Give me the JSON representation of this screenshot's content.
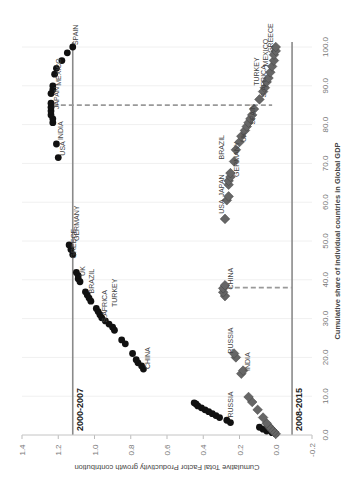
{
  "chart_data": {
    "type": "scatter",
    "orientation": "rotated 90deg clockwise",
    "title": "",
    "xlabel": "Cumulative share of individual countries in Global GDP",
    "ylabel": "Cumulative Total Factor Productivity growth contribution",
    "xlim": [
      0,
      100
    ],
    "ylim": [
      -0.2,
      1.4
    ],
    "x_ticks": [
      "0.0",
      "10.0",
      "20.0",
      "30.0",
      "40.0",
      "50.0",
      "60.0",
      "70.0",
      "80.0",
      "90.0",
      "100.0"
    ],
    "y_ticks": [
      "-0.2",
      "0.0",
      "0.2",
      "0.4",
      "0.6",
      "0.8",
      "1.0",
      "1.2",
      "1.4"
    ],
    "grid": "vertical gridlines (light)",
    "legend": "none (period labels inline)",
    "reference_lines": [
      {
        "type": "horizontal",
        "series": "2000-2007",
        "y": 1.12,
        "label": "2000-2007"
      },
      {
        "type": "horizontal",
        "series": "2008-2015",
        "y": -0.09,
        "label": "2008-2015"
      },
      {
        "type": "vertical-dashed",
        "x": 85,
        "from_y": 0.02,
        "to_y": 1.23
      },
      {
        "type": "vertical-dashed",
        "x": 38,
        "from_y": -0.09,
        "to_y": 0.27
      }
    ],
    "series": [
      {
        "name": "2000-2007",
        "marker": "circle",
        "color": "#111111",
        "points": [
          [
            0.3,
            0.0
          ],
          [
            0.6,
            0.02
          ],
          [
            1.0,
            0.05
          ],
          [
            1.5,
            0.07
          ],
          [
            2.0,
            0.09
          ],
          [
            3.2,
            0.25
          ],
          [
            3.8,
            0.27
          ],
          [
            4.5,
            0.31
          ],
          [
            5.0,
            0.33
          ],
          [
            5.5,
            0.35
          ],
          [
            6.0,
            0.37
          ],
          [
            6.5,
            0.39
          ],
          [
            7.0,
            0.41
          ],
          [
            7.5,
            0.43
          ],
          [
            8.0,
            0.44
          ],
          [
            8.3,
            0.45
          ],
          [
            17.0,
            0.73
          ],
          [
            17.8,
            0.74
          ],
          [
            18.6,
            0.76
          ],
          [
            19.4,
            0.77
          ],
          [
            21.0,
            0.79
          ],
          [
            23.5,
            0.83
          ],
          [
            24.5,
            0.85
          ],
          [
            27.0,
            0.89
          ],
          [
            27.8,
            0.9
          ],
          [
            28.6,
            0.92
          ],
          [
            29.4,
            0.94
          ],
          [
            30.2,
            0.96
          ],
          [
            31.0,
            0.97
          ],
          [
            31.8,
            0.98
          ],
          [
            32.6,
            0.99
          ],
          [
            34.5,
            1.02
          ],
          [
            35.3,
            1.03
          ],
          [
            36.1,
            1.04
          ],
          [
            36.9,
            1.05
          ],
          [
            39.5,
            1.08
          ],
          [
            40.3,
            1.09
          ],
          [
            41.1,
            1.09
          ],
          [
            41.9,
            1.1
          ],
          [
            46.5,
            1.12
          ],
          [
            47.8,
            1.13
          ],
          [
            49.0,
            1.14
          ],
          [
            71.5,
            1.2
          ],
          [
            75.0,
            1.21
          ],
          [
            80.5,
            1.23
          ],
          [
            81.5,
            1.23
          ],
          [
            82.5,
            1.24
          ],
          [
            83.5,
            1.24
          ],
          [
            84.5,
            1.24
          ],
          [
            85.5,
            1.24
          ],
          [
            88.0,
            1.24
          ],
          [
            89.0,
            1.23
          ],
          [
            90.0,
            1.23
          ],
          [
            93.0,
            1.22
          ],
          [
            94.5,
            1.21
          ],
          [
            96.5,
            1.18
          ],
          [
            98.5,
            1.15
          ],
          [
            100.0,
            1.12
          ]
        ],
        "labels": [
          {
            "text": "RUSSIA",
            "x": 4.5,
            "y": 0.25
          },
          {
            "text": "CHINA",
            "x": 17.0,
            "y": 0.71
          },
          {
            "text": "S.AFRICA",
            "x": 29.0,
            "y": 0.95
          },
          {
            "text": "TURKEY",
            "x": 33.0,
            "y": 0.89
          },
          {
            "text": "BRAZIL",
            "x": 36.5,
            "y": 1.02
          },
          {
            "text": "UK",
            "x": 41.0,
            "y": 1.07
          },
          {
            "text": "GREECE",
            "x": 45.5,
            "y": 1.12
          },
          {
            "text": "GERMANY",
            "x": 50.0,
            "y": 1.1
          },
          {
            "text": "USA",
            "x": 72.0,
            "y": 1.18
          },
          {
            "text": "INDIA",
            "x": 76.0,
            "y": 1.19
          },
          {
            "text": "JAPAN",
            "x": 84.0,
            "y": 1.21
          },
          {
            "text": "MEXICO",
            "x": 90.0,
            "y": 1.2
          },
          {
            "text": "SPAIN",
            "x": 100.5,
            "y": 1.11
          }
        ]
      },
      {
        "name": "2008-2015",
        "marker": "diamond",
        "color": "#666666",
        "points": [
          [
            0.3,
            0.0
          ],
          [
            0.8,
            0.01
          ],
          [
            1.3,
            0.02
          ],
          [
            1.8,
            0.03
          ],
          [
            2.3,
            0.04
          ],
          [
            3.0,
            0.05
          ],
          [
            4.5,
            0.07
          ],
          [
            6.5,
            0.1
          ],
          [
            8.5,
            0.13
          ],
          [
            9.8,
            0.15
          ],
          [
            15.8,
            0.19
          ],
          [
            16.6,
            0.18
          ],
          [
            20.0,
            0.22
          ],
          [
            21.0,
            0.23
          ],
          [
            35.8,
            0.28
          ],
          [
            36.8,
            0.29
          ],
          [
            37.8,
            0.29
          ],
          [
            38.6,
            0.28
          ],
          [
            55.7,
            0.28
          ],
          [
            60.5,
            0.27
          ],
          [
            61.5,
            0.26
          ],
          [
            64.5,
            0.26
          ],
          [
            65.5,
            0.26
          ],
          [
            66.5,
            0.25
          ],
          [
            67.5,
            0.25
          ],
          [
            70.5,
            0.23
          ],
          [
            73.5,
            0.22
          ],
          [
            75.5,
            0.2
          ],
          [
            77.0,
            0.19
          ],
          [
            78.5,
            0.17
          ],
          [
            79.5,
            0.16
          ],
          [
            80.5,
            0.15
          ],
          [
            81.5,
            0.14
          ],
          [
            82.5,
            0.13
          ],
          [
            84.0,
            0.12
          ],
          [
            86.5,
            0.09
          ],
          [
            88.5,
            0.07
          ],
          [
            89.5,
            0.06
          ],
          [
            91.0,
            0.05
          ],
          [
            92.0,
            0.04
          ],
          [
            93.5,
            0.03
          ],
          [
            95.0,
            0.02
          ],
          [
            96.5,
            0.01
          ],
          [
            98.0,
            0.01
          ],
          [
            99.0,
            0.0
          ],
          [
            100.0,
            0.0
          ]
        ],
        "labels": [
          {
            "text": "INDIA",
            "x": 16.5,
            "y": 0.16
          },
          {
            "text": "RUSSIA",
            "x": 21.0,
            "y": 0.25
          },
          {
            "text": "CHINA",
            "x": 37.5,
            "y": 0.25
          },
          {
            "text": "USA",
            "x": 57.0,
            "y": 0.3
          },
          {
            "text": "JAPAN",
            "x": 61.5,
            "y": 0.3
          },
          {
            "text": "GERMANY",
            "x": 66.5,
            "y": 0.22
          },
          {
            "text": "BRAZIL",
            "x": 71.0,
            "y": 0.3
          },
          {
            "text": "UK",
            "x": 75.5,
            "y": 0.18
          },
          {
            "text": "SPAIN",
            "x": 80.0,
            "y": 0.13
          },
          {
            "text": "S.AFRICA",
            "x": 87.0,
            "y": 0.07
          },
          {
            "text": "TURKEY",
            "x": 90.0,
            "y": 0.11
          },
          {
            "text": "MEXICO",
            "x": 95.0,
            "y": 0.06
          },
          {
            "text": "GREECE",
            "x": 98.5,
            "y": 0.03
          }
        ]
      }
    ]
  }
}
